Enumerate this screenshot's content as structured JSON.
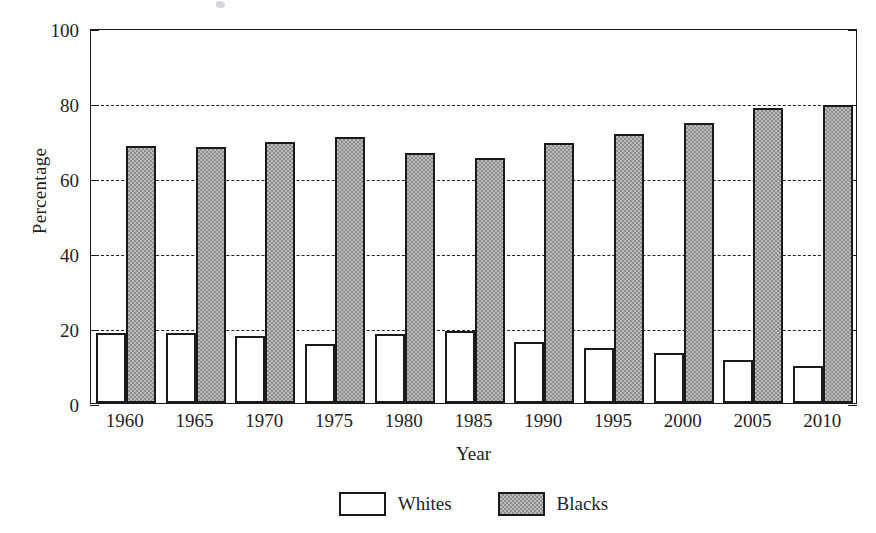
{
  "chart_data": {
    "type": "bar",
    "title": "",
    "xlabel": "Year",
    "ylabel": "Percentage",
    "categories": [
      "1960",
      "1965",
      "1970",
      "1975",
      "1980",
      "1985",
      "1990",
      "1995",
      "2000",
      "2005",
      "2010"
    ],
    "series": [
      {
        "name": "Whites",
        "fill": "white",
        "values": [
          18.7,
          18.6,
          18.0,
          15.8,
          18.3,
          19.2,
          16.3,
          14.7,
          13.4,
          11.5,
          10.0
        ]
      },
      {
        "name": "Blacks",
        "fill": "gray-hatch",
        "values": [
          68.5,
          68.4,
          69.6,
          71.0,
          66.8,
          65.3,
          69.4,
          71.8,
          74.8,
          78.6,
          79.5
        ]
      }
    ],
    "ylim": [
      0,
      100
    ],
    "yticks": [
      0,
      20,
      40,
      60,
      80,
      100
    ],
    "ytick_labels": [
      "0",
      "20",
      "40",
      "60",
      "80",
      "100"
    ],
    "grid": {
      "horizontal": true,
      "style": "dashed",
      "at": [
        20,
        40,
        60,
        80
      ]
    },
    "legend": {
      "position": "bottom-center",
      "entries": [
        "Whites",
        "Blacks"
      ]
    },
    "colors": {
      "axis": "#1a1a1a",
      "grid": "#222222",
      "whites_fill": "#ffffff",
      "blacks_fill": "#b9b9b9",
      "blacks_hatch": "#8f8f8f",
      "text": "#1f1f1f",
      "background": "#ffffff"
    }
  }
}
